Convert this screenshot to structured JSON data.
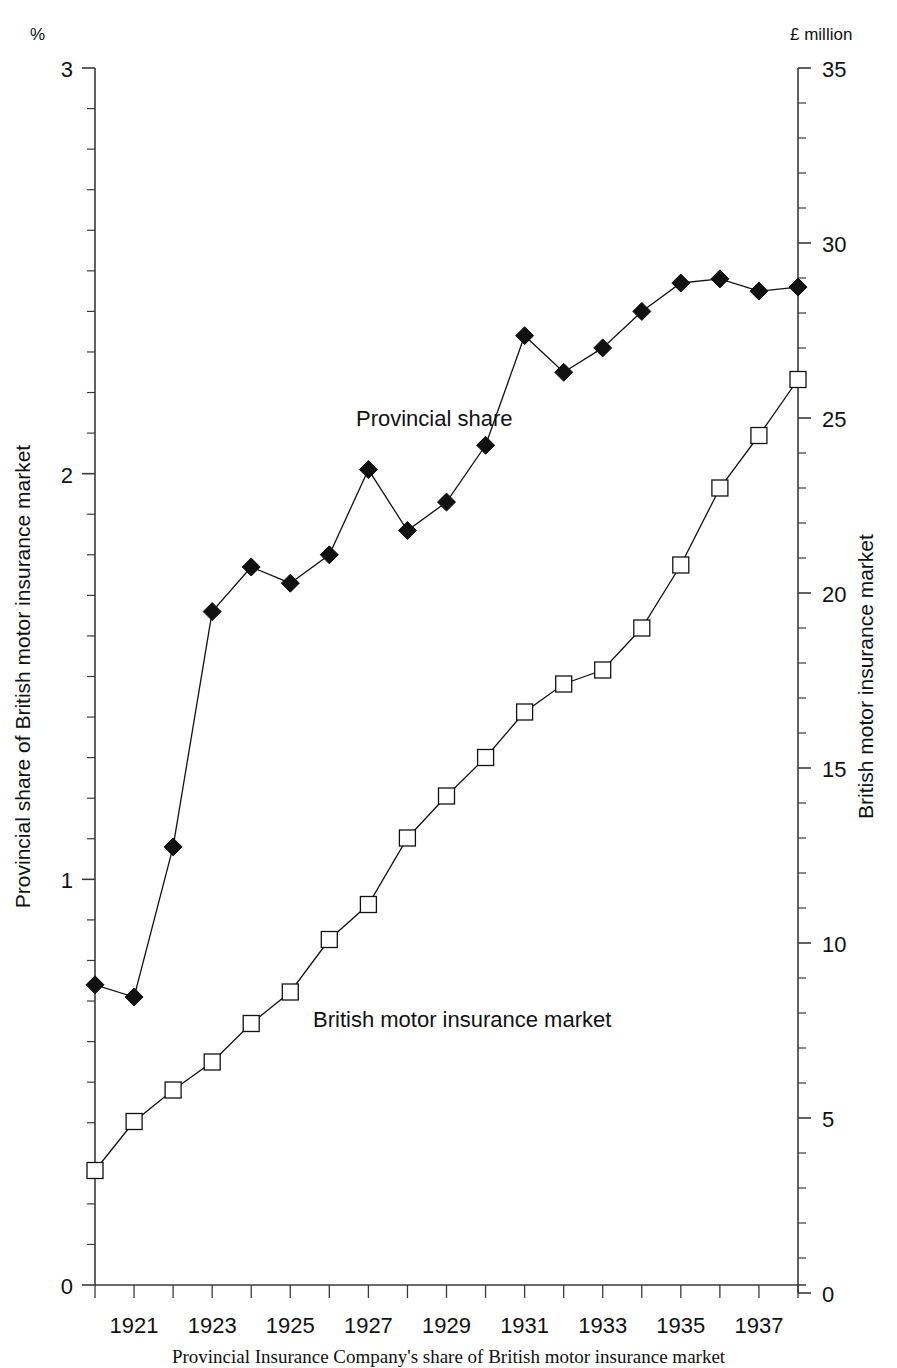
{
  "chart_data": {
    "type": "line",
    "title": "",
    "caption": "Provincial Insurance Company's share of British motor insurance market",
    "x": [
      1920,
      1921,
      1922,
      1923,
      1924,
      1925,
      1926,
      1927,
      1928,
      1929,
      1930,
      1931,
      1932,
      1933,
      1934,
      1935,
      1936,
      1937,
      1938
    ],
    "xlabel": "",
    "xlim": [
      1920,
      1938
    ],
    "xtick_labels": [
      "1921",
      "1923",
      "1925",
      "1927",
      "1929",
      "1931",
      "1933",
      "1935",
      "1937"
    ],
    "xtick_values": [
      1921,
      1923,
      1925,
      1927,
      1929,
      1931,
      1933,
      1935,
      1937
    ],
    "grid": false,
    "legend_position": "inline-annotations",
    "left_axis": {
      "unit_label": "%",
      "title": "Provincial share of British motor insurance market",
      "ylim": [
        0,
        3
      ],
      "ytick_labels": [
        "0",
        "1",
        "2",
        "3"
      ],
      "ytick_values": [
        0,
        1,
        2,
        3
      ],
      "minor_tick_step": 0.1
    },
    "right_axis": {
      "unit_label": "£ million",
      "title": "British motor insurance market",
      "ylim": [
        0,
        35
      ],
      "ytick_labels": [
        "0",
        "5",
        "10",
        "15",
        "20",
        "25",
        "30",
        "35"
      ],
      "ytick_values": [
        0,
        5,
        10,
        15,
        20,
        25,
        30,
        35
      ],
      "minor_tick_step": 1
    },
    "series": [
      {
        "name": "Provincial share",
        "axis": "left",
        "marker": "filled-diamond",
        "color": "#111111",
        "label_text": "Provincial share",
        "values": [
          0.74,
          0.71,
          1.08,
          1.66,
          1.77,
          1.73,
          1.8,
          2.01,
          1.86,
          1.93,
          2.07,
          2.34,
          2.25,
          2.31,
          2.4,
          2.47,
          2.48,
          2.45,
          2.46
        ]
      },
      {
        "name": "British motor insurance market",
        "axis": "right",
        "marker": "open-square",
        "color": "#111111",
        "label_text": "British motor insurance market",
        "values": [
          3.5,
          4.9,
          5.8,
          6.6,
          7.7,
          8.6,
          10.1,
          11.1,
          13.0,
          14.2,
          15.3,
          16.6,
          17.4,
          17.8,
          19.0,
          20.8,
          23.0,
          24.5,
          26.1
        ]
      }
    ]
  }
}
